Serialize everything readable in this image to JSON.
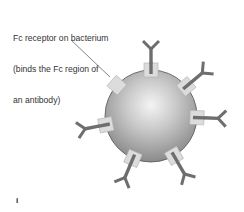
{
  "figure": {
    "label_lines": [
      "Fc receptor on bacterium",
      "(binds the Fc region of",
      "an antibody)"
    ],
    "panel_letter": "i"
  },
  "colors": {
    "sphere_light": "#f2f2f2",
    "sphere_mid": "#c4c4c4",
    "sphere_dark": "#8e8e8e",
    "sphere_outline": "#555555",
    "receptor_fill": "#dcdcdc",
    "receptor_stroke": "#b0b0b0",
    "antibody": "#6e6e6e",
    "pointer_line": "#666666"
  },
  "diagram": {
    "bacterium": {
      "cx": 151,
      "cy": 116,
      "r": 46
    },
    "receptors": [
      {
        "angle": -90,
        "antibody": true
      },
      {
        "angle": -40,
        "antibody": true
      },
      {
        "angle": 2,
        "antibody": true
      },
      {
        "angle": 60,
        "antibody": true
      },
      {
        "angle": 113,
        "antibody": true
      },
      {
        "angle": 169,
        "antibody": true
      },
      {
        "angle": -138,
        "antibody": false,
        "labeled": true
      }
    ],
    "pointer": {
      "x1": 71,
      "y1": 40,
      "x2": 110,
      "y2": 77
    }
  }
}
